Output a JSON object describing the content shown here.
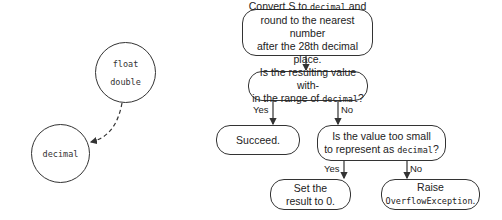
{
  "circles": {
    "source": {
      "line1": "float",
      "line2": "double"
    },
    "target": {
      "label": "decimal"
    }
  },
  "flow": {
    "step1": {
      "pre": "Convert S to ",
      "code": "decimal",
      "post": " and",
      "line2": "round to the nearest number",
      "line3": "after the 28th decimal place."
    },
    "step2": {
      "line1": "Is the resulting value with-",
      "pre": "in the range of ",
      "code": "decimal",
      "post": "?"
    },
    "yes1": "Yes",
    "no1": "No",
    "succeed": "Succeed.",
    "step3": {
      "line1": "Is the value too small",
      "pre": "to represent as ",
      "code": "decimal",
      "post": "?"
    },
    "yes2": "Yes",
    "no2": "No",
    "set_zero": {
      "line1": "Set the",
      "line2": "result to 0."
    },
    "raise": {
      "line1": "Raise",
      "code": "OverflowException",
      "post": "."
    }
  }
}
